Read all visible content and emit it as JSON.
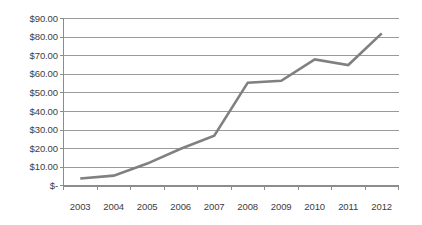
{
  "chart_data": {
    "type": "line",
    "title": "",
    "subtitle": "",
    "xlabel": "",
    "ylabel": "",
    "categories": [
      "2003",
      "2004",
      "2005",
      "2006",
      "2007",
      "2008",
      "2009",
      "2010",
      "2011",
      "2012"
    ],
    "series": [
      {
        "name": "Series 1",
        "color": "#808080",
        "values": [
          4.0,
          5.5,
          12.0,
          20.0,
          27.0,
          55.5,
          56.5,
          68.0,
          65.0,
          82.0
        ]
      }
    ],
    "ylim": [
      0,
      90
    ],
    "ytick_values": [
      0,
      10,
      20,
      30,
      40,
      50,
      60,
      70,
      80,
      90
    ],
    "ytick_labels": [
      "$-",
      "$10.00",
      "$20.00",
      "$30.00",
      "$40.00",
      "$50.00",
      "$60.00",
      "$70.00",
      "$80.00",
      "$90.00"
    ],
    "xtick_labels": [
      "2003",
      "2004",
      "2005",
      "2006",
      "2007",
      "2008",
      "2009",
      "2010",
      "2011",
      "2012"
    ],
    "grid": true,
    "grid_axis": "y",
    "legend": false,
    "legend_position": "none",
    "annotations": []
  },
  "colors": {
    "series_line": "#808080",
    "gridline": "#9a9a9a",
    "axis": "#8c8c8c",
    "text": "#3d3d3d",
    "background": "#ffffff"
  }
}
